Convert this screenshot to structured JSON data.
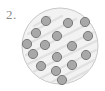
{
  "figure": {
    "label": "2.",
    "label_color": "#8a8a8a",
    "background_color": "#ffffff",
    "canvas": {
      "width": 105,
      "height": 91
    },
    "type": "schematic-diagram"
  },
  "dish": {
    "name": "circular-region",
    "center_x": 60,
    "center_y": 46,
    "radius": 38,
    "fill_color": "#f2f2f2",
    "stroke_color": "#c8c8c8",
    "stroke_width": 1
  },
  "striations": {
    "name": "diagonal-hatch-lines",
    "color": "#e0e0e0",
    "stroke_width": 2.2,
    "angle_deg": -28,
    "count": 9,
    "lines": [
      {
        "x1": 28,
        "y1": 34,
        "x2": 62,
        "y2": 16
      },
      {
        "x1": 26,
        "y1": 45,
        "x2": 76,
        "y2": 19
      },
      {
        "x1": 26,
        "y1": 55,
        "x2": 88,
        "y2": 24
      },
      {
        "x1": 28,
        "y1": 64,
        "x2": 94,
        "y2": 32
      },
      {
        "x1": 33,
        "y1": 72,
        "x2": 96,
        "y2": 41
      },
      {
        "x1": 41,
        "y1": 78,
        "x2": 96,
        "y2": 50
      },
      {
        "x1": 52,
        "y1": 82,
        "x2": 94,
        "y2": 60
      },
      {
        "x1": 64,
        "y1": 83,
        "x2": 89,
        "y2": 70
      },
      {
        "x1": 34,
        "y1": 26,
        "x2": 50,
        "y2": 17
      }
    ]
  },
  "particles": {
    "name": "particle-set",
    "count": 16,
    "radius": 4.6,
    "fill_color": "#a8a8a8",
    "stroke_color": "#7a7a7a",
    "stroke_width": 1,
    "points": [
      {
        "id": 1,
        "cx": 46,
        "cy": 21
      },
      {
        "id": 2,
        "cx": 68,
        "cy": 23
      },
      {
        "id": 3,
        "cx": 85,
        "cy": 22
      },
      {
        "id": 4,
        "cx": 36,
        "cy": 33
      },
      {
        "id": 5,
        "cx": 57,
        "cy": 36
      },
      {
        "id": 6,
        "cx": 88,
        "cy": 36
      },
      {
        "id": 7,
        "cx": 27,
        "cy": 44
      },
      {
        "id": 8,
        "cx": 45,
        "cy": 45
      },
      {
        "id": 9,
        "cx": 72,
        "cy": 46
      },
      {
        "id": 10,
        "cx": 33,
        "cy": 54
      },
      {
        "id": 11,
        "cx": 57,
        "cy": 57
      },
      {
        "id": 12,
        "cx": 86,
        "cy": 55
      },
      {
        "id": 13,
        "cx": 41,
        "cy": 66
      },
      {
        "id": 14,
        "cx": 72,
        "cy": 65
      },
      {
        "id": 15,
        "cx": 56,
        "cy": 71
      },
      {
        "id": 16,
        "cx": 62,
        "cy": 80
      }
    ]
  }
}
